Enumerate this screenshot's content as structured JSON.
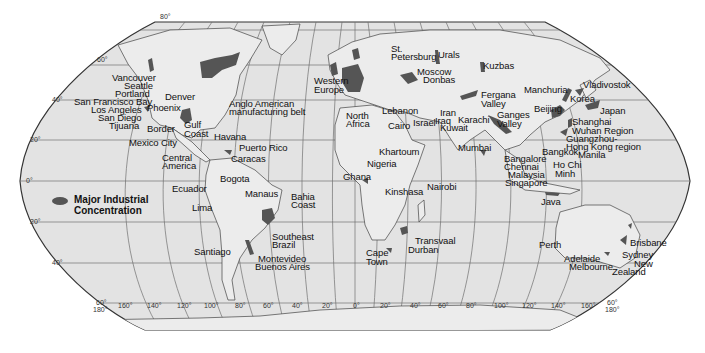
{
  "map": {
    "colors": {
      "ocean": "#e2e2e2",
      "land": "#ebebeb",
      "industrial": "#555555",
      "border": "#444444",
      "grid": "#6a6a6a",
      "background": "#ffffff"
    },
    "legend": {
      "line1": "Major Industrial",
      "line2": "Concentration"
    },
    "latitude_labels": {
      "top": "80°",
      "n60": "60°",
      "n40": "40°",
      "n20": "20°",
      "eq": "0°",
      "s20": "20°",
      "s40": "40°",
      "s60_left": "60°",
      "lon180_left": "180°",
      "s60_right": "60°",
      "lon180_right": "180°"
    },
    "longitude_labels": [
      "160°",
      "140°",
      "120°",
      "100°",
      "80°",
      "60°",
      "40°",
      "20°",
      "0°",
      "20°",
      "40°",
      "60°",
      "80°",
      "100°",
      "120°",
      "140°",
      "160°"
    ],
    "places": {
      "vancouver": "Vancouver",
      "seattle": "Seattle",
      "portland": "Portland",
      "sf_bay": "San Francisco Bay",
      "los_angeles": "Los Angeles",
      "san_diego": "San Diego",
      "tijuana": "Tijuana",
      "denver": "Denver",
      "phoenix": "Phoenix",
      "border": "Border",
      "gulf1": "Gulf",
      "gulf2": "Coast",
      "mexico_city": "Mexico City",
      "central1": "Central",
      "central2": "America",
      "havana": "Havana",
      "puerto_rico": "Puerto Rico",
      "caracas": "Caracas",
      "bogota": "Bogota",
      "ecuador": "Ecuador",
      "lima": "Lima",
      "manaus": "Manaus",
      "bahia1": "Bahia",
      "bahia2": "Coast",
      "se_brazil1": "Southeast",
      "se_brazil2": "Brazil",
      "santiago": "Santiago",
      "montevideo": "Montevideo",
      "buenos_aires": "Buenos Aires",
      "anglo1": "Anglo American",
      "anglo2": "manufacturing belt",
      "w_europe1": "Western",
      "w_europe2": "Europe",
      "st_pete1": "St.",
      "st_pete2": "Petersburg",
      "urals": "Urals",
      "moscow": "Moscow",
      "donbas": "Donbas",
      "kuzbas": "Kuzbas",
      "n_africa1": "North",
      "n_africa2": "Africa",
      "lebanon": "Lebanon",
      "cairo": "Cairo",
      "israel": "Israel",
      "iran": "Iran",
      "iraq": "Iraq",
      "kuwait": "Kuwait",
      "karachi": "Karachi",
      "fergana1": "Fergana",
      "fergana2": "Valley",
      "ganges1": "Ganges",
      "ganges2": "Valley",
      "mumbai": "Mumbai",
      "khartoum": "Khartoum",
      "nigeria": "Nigeria",
      "ghana": "Ghana",
      "kinshasa": "Kinshasa",
      "nairobi": "Nairobi",
      "transvaal": "Transvaal",
      "durban": "Durban",
      "cape1": "Cape",
      "cape2": "Town",
      "manchuria": "Manchuria",
      "vladivostok": "Vladivostok",
      "korea": "Korea",
      "japan": "Japan",
      "beijing": "Beijing",
      "shanghai": "Shanghai",
      "wuhan": "Wuhan Region",
      "guangzhou": "Guangzhou-",
      "hong_kong": "Hong Kong region",
      "manila": "Manila",
      "bangkok": "Bangkok",
      "bangalore": "Bangalore",
      "chennai": "Chennai",
      "malaysia": "Malaysia",
      "singapore": "Singapore",
      "ho_chi1": "Ho Chi",
      "ho_chi2": "Minh",
      "java": "Java",
      "perth": "Perth",
      "adelaide": "Adelaide",
      "melbourne": "Melbourne",
      "brisbane": "Brisbane",
      "sydney": "Sydney",
      "nz1": "New",
      "nz2": "Zealand"
    }
  }
}
